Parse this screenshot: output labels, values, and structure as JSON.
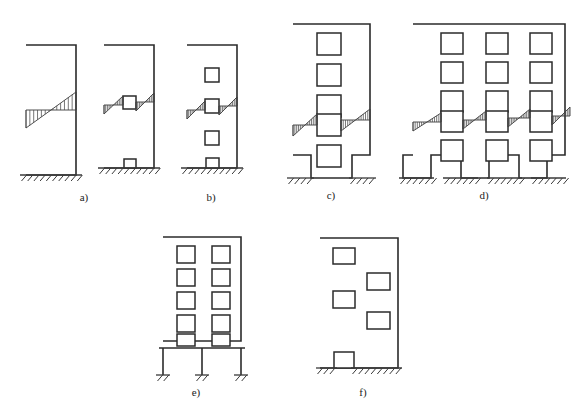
{
  "figure": {
    "background_color": "#ffffff",
    "line_color": "#2b2b2b",
    "hatch_color": "#4a4a4a",
    "width": 588,
    "height": 419
  },
  "captions": [
    {
      "id": "a",
      "label": "a)",
      "x": 84,
      "y": 201
    },
    {
      "id": "b",
      "label": "b)",
      "x": 211,
      "y": 201
    },
    {
      "id": "c",
      "label": "c)",
      "x": 331,
      "y": 199
    },
    {
      "id": "d",
      "label": "d)",
      "x": 484,
      "y": 199
    },
    {
      "id": "e",
      "label": "e)",
      "x": 196,
      "y": 396
    },
    {
      "id": "f",
      "label": "f)",
      "x": 363,
      "y": 396
    }
  ],
  "panels": [
    {
      "id": "a",
      "label": "a)",
      "description": "Solid cantilever wall and wall with single opening",
      "walls": [
        {
          "name": "solid-wall",
          "outline": "26,45 76,45 76,175 26,175",
          "openings": [],
          "ground": {
            "x1": 20,
            "x2": 82,
            "y": 175
          },
          "shear_bands": [
            {
              "x1": 26,
              "x2": 76,
              "y": 110,
              "rise": 18
            }
          ]
        },
        {
          "name": "wall-with-opening",
          "outline": "104,45 154,45 154,168 104,168",
          "openings": [
            {
              "name": "mid-window",
              "x": 123,
              "y": 96,
              "w": 13,
              "h": 13
            },
            {
              "name": "base-door",
              "x": 124,
              "y": 159,
              "w": 12,
              "h": 9
            }
          ],
          "ground": {
            "x1": 98,
            "x2": 160,
            "y": 168
          },
          "shear_bands": [
            {
              "x1": 104,
              "x2": 123,
              "y": 105,
              "rise": 9
            },
            {
              "x1": 136,
              "x2": 154,
              "y": 102,
              "rise": 9
            }
          ]
        }
      ]
    },
    {
      "id": "b",
      "label": "b)",
      "description": "Slender wall with a vertical row of openings",
      "walls": [
        {
          "name": "pierced-wall",
          "outline": "187,45 237,45 237,168 187,168",
          "openings": [
            {
              "name": "window-1",
              "x": 205,
              "y": 68,
              "w": 14,
              "h": 14
            },
            {
              "name": "window-2",
              "x": 205,
              "y": 99,
              "w": 14,
              "h": 14
            },
            {
              "name": "window-3",
              "x": 205,
              "y": 131,
              "w": 14,
              "h": 14
            },
            {
              "name": "base-door",
              "x": 206,
              "y": 158,
              "w": 13,
              "h": 10
            }
          ],
          "ground": {
            "x1": 181,
            "x2": 243,
            "y": 168
          },
          "shear_bands": [
            {
              "x1": 187,
              "x2": 205,
              "y": 110,
              "rise": 9
            },
            {
              "x1": 219,
              "x2": 237,
              "y": 106,
              "rise": 9
            }
          ]
        }
      ]
    },
    {
      "id": "c",
      "label": "c)",
      "description": "Five-storey wall, single window column, door at base",
      "walls": [
        {
          "name": "single-bay-wall",
          "outline": "293,24 370,24 370,155 352,155 352,178 311,178 311,155 293,155",
          "openings": [
            {
              "name": "window-1",
              "x": 317,
              "y": 33,
              "w": 24,
              "h": 22
            },
            {
              "name": "window-2",
              "x": 317,
              "y": 64,
              "w": 24,
              "h": 22
            },
            {
              "name": "window-3",
              "x": 317,
              "y": 95,
              "w": 24,
              "h": 22
            },
            {
              "name": "window-4",
              "x": 317,
              "y": 114,
              "w": 24,
              "h": 22
            },
            {
              "name": "window-5",
              "x": 317,
              "y": 145,
              "w": 24,
              "h": 22
            }
          ],
          "ground_segments": [
            {
              "x1": 287,
              "x2": 314,
              "y": 178
            },
            {
              "x1": 349,
              "x2": 376,
              "y": 178
            }
          ],
          "shear_bands": [
            {
              "x1": 293,
              "x2": 317,
              "y": 125,
              "rise": 11
            },
            {
              "x1": 341,
              "x2": 370,
              "y": 120,
              "rise": 11
            }
          ]
        }
      ]
    },
    {
      "id": "d",
      "label": "d)",
      "description": "Five-storey wall, three window columns, three door openings at base",
      "walls": [
        {
          "name": "multi-bay-wall",
          "outline": "413,24 565,24 565,155 547,155 547,178 519,178 519,155 489,155 489,178 461,178 461,155 431,155 431,178 403,178 403,155 413,155",
          "openings": [
            {
              "name": "window-r1c1",
              "x": 441,
              "y": 33,
              "w": 22,
              "h": 21
            },
            {
              "name": "window-r1c2",
              "x": 486,
              "y": 33,
              "w": 22,
              "h": 21
            },
            {
              "name": "window-r1c3",
              "x": 530,
              "y": 33,
              "w": 22,
              "h": 21
            },
            {
              "name": "window-r2c1",
              "x": 441,
              "y": 62,
              "w": 22,
              "h": 21
            },
            {
              "name": "window-r2c2",
              "x": 486,
              "y": 62,
              "w": 22,
              "h": 21
            },
            {
              "name": "window-r2c3",
              "x": 530,
              "y": 62,
              "w": 22,
              "h": 21
            },
            {
              "name": "window-r3c1",
              "x": 441,
              "y": 91,
              "w": 22,
              "h": 21
            },
            {
              "name": "window-r3c2",
              "x": 486,
              "y": 91,
              "w": 22,
              "h": 21
            },
            {
              "name": "window-r3c3",
              "x": 530,
              "y": 91,
              "w": 22,
              "h": 21
            },
            {
              "name": "window-r4c1",
              "x": 441,
              "y": 111,
              "w": 22,
              "h": 21
            },
            {
              "name": "window-r4c2",
              "x": 486,
              "y": 111,
              "w": 22,
              "h": 21
            },
            {
              "name": "window-r4c3",
              "x": 530,
              "y": 111,
              "w": 22,
              "h": 21
            },
            {
              "name": "window-r5c1",
              "x": 441,
              "y": 140,
              "w": 22,
              "h": 21
            },
            {
              "name": "window-r5c2",
              "x": 486,
              "y": 140,
              "w": 22,
              "h": 21
            },
            {
              "name": "window-r5c3",
              "x": 530,
              "y": 140,
              "w": 22,
              "h": 21
            }
          ],
          "ground_segments": [
            {
              "x1": 399,
              "x2": 434,
              "y": 178
            },
            {
              "x1": 443,
              "x2": 478,
              "y": 178
            },
            {
              "x1": 487,
              "x2": 522,
              "y": 178
            },
            {
              "x1": 531,
              "x2": 566,
              "y": 178
            }
          ],
          "shear_bands": [
            {
              "x1": 413,
              "x2": 441,
              "y": 122,
              "rise": 9
            },
            {
              "x1": 463,
              "x2": 486,
              "y": 120,
              "rise": 9
            },
            {
              "x1": 508,
              "x2": 530,
              "y": 118,
              "rise": 9
            },
            {
              "x1": 552,
              "x2": 570,
              "y": 116,
              "rise": 9
            }
          ]
        }
      ]
    },
    {
      "id": "e",
      "label": "e)",
      "description": "Soft-storey building: pierced wall block on open pilotis columns",
      "walls": [
        {
          "name": "soft-storey-wall",
          "outline": "163,237 241,237 241,341 163,341",
          "openings": [
            {
              "name": "window-l1",
              "x": 177,
              "y": 246,
              "w": 18,
              "h": 17
            },
            {
              "name": "window-l2",
              "x": 177,
              "y": 269,
              "w": 18,
              "h": 17
            },
            {
              "name": "window-l3",
              "x": 177,
              "y": 292,
              "w": 18,
              "h": 17
            },
            {
              "name": "window-l4",
              "x": 177,
              "y": 315,
              "w": 18,
              "h": 17
            },
            {
              "name": "window-l5",
              "x": 177,
              "y": 334,
              "w": 18,
              "h": 12
            },
            {
              "name": "window-r1",
              "x": 212,
              "y": 246,
              "w": 18,
              "h": 17
            },
            {
              "name": "window-r2",
              "x": 212,
              "y": 269,
              "w": 18,
              "h": 17
            },
            {
              "name": "window-r3",
              "x": 212,
              "y": 292,
              "w": 18,
              "h": 17
            },
            {
              "name": "window-r4",
              "x": 212,
              "y": 315,
              "w": 18,
              "h": 17
            },
            {
              "name": "window-r5",
              "x": 212,
              "y": 334,
              "w": 18,
              "h": 12
            }
          ],
          "pilotis": {
            "beam_y": 348,
            "beam_x1": 159,
            "beam_x2": 245,
            "base_y": 375,
            "columns": [
              {
                "name": "column-left",
                "x": 163
              },
              {
                "name": "column-center",
                "x": 202
              },
              {
                "name": "column-right",
                "x": 241
              }
            ]
          },
          "shear_bands": []
        }
      ]
    },
    {
      "id": "f",
      "label": "f)",
      "description": "Wall with irregularly distributed openings",
      "walls": [
        {
          "name": "irregular-wall",
          "outline": "320,238 398,238 398,368 320,368",
          "openings": [
            {
              "name": "window-upper-left",
              "x": 333,
              "y": 248,
              "w": 22,
              "h": 16
            },
            {
              "name": "window-upper-right",
              "x": 367,
              "y": 273,
              "w": 23,
              "h": 17
            },
            {
              "name": "window-mid-left",
              "x": 333,
              "y": 291,
              "w": 22,
              "h": 17
            },
            {
              "name": "window-lower-right",
              "x": 367,
              "y": 312,
              "w": 23,
              "h": 17
            },
            {
              "name": "base-door",
              "x": 334,
              "y": 352,
              "w": 20,
              "h": 16
            }
          ],
          "ground_segments": [
            {
              "x1": 316,
              "x2": 337,
              "y": 368
            },
            {
              "x1": 351,
              "x2": 402,
              "y": 368
            }
          ],
          "shear_bands": []
        }
      ]
    }
  ]
}
